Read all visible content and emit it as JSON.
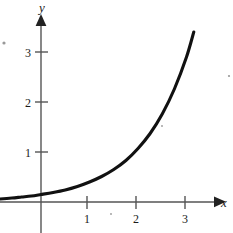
{
  "figure": {
    "title": "",
    "background_color": "#ffffff",
    "curve_color": "#111111",
    "axis_color": "#555555"
  },
  "axes": {
    "x": {
      "label": "x",
      "ticks": [
        1,
        2,
        3
      ],
      "tick_labels": [
        "1",
        "2",
        "3"
      ],
      "range": [
        -0.85,
        3.6
      ],
      "arrow": true
    },
    "y": {
      "label": "y",
      "ticks": [
        1,
        2,
        3
      ],
      "tick_labels": [
        "1",
        "2",
        "3"
      ],
      "range": [
        -0.2,
        3.8
      ],
      "arrow": true
    }
  },
  "labels": {
    "y_axis": "y",
    "x_axis": "x",
    "y_tick_3": "3",
    "y_tick_2": "2",
    "y_tick_1": "1",
    "x_tick_1": "1",
    "x_tick_2": "2",
    "x_tick_3": "3"
  },
  "chart_data": {
    "type": "line",
    "title": "",
    "xlabel": "x",
    "ylabel": "y",
    "xlim": [
      -0.85,
      3.6
    ],
    "ylim": [
      -0.2,
      3.8
    ],
    "grid": false,
    "legend": null,
    "series": [
      {
        "name": "exponential curve",
        "description": "increasing exponential curve, concave up, approaching zero on the left",
        "x": [
          -0.85,
          -0.6,
          -0.4,
          -0.2,
          0,
          0.25,
          0.5,
          0.75,
          1,
          1.25,
          1.5,
          1.75,
          2,
          2.25,
          2.5,
          2.75,
          3,
          3.15
        ],
        "y": [
          0.06,
          0.08,
          0.1,
          0.12,
          0.15,
          0.19,
          0.24,
          0.31,
          0.4,
          0.51,
          0.65,
          0.83,
          1.07,
          1.37,
          1.76,
          2.26,
          2.9,
          3.4
        ]
      }
    ],
    "xticks": [
      1,
      2,
      3
    ],
    "yticks": [
      1,
      2,
      3
    ]
  }
}
